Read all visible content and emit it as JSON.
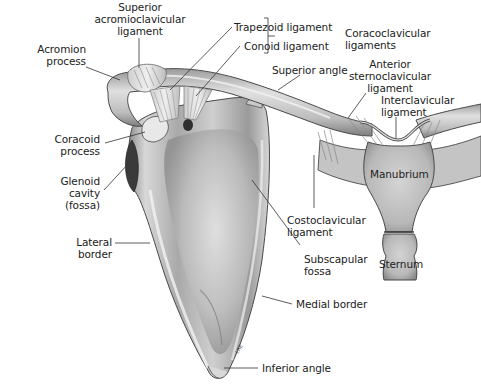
{
  "figure": {
    "signature": "LRE",
    "bottom_caption_cropped": ""
  },
  "labels": {
    "superior_acromioclavicular_ligament": "Superior\nacromioclavicular\nligament",
    "acromion_process": "Acromion\nprocess",
    "trapezoid_ligament": "Trapezoid ligament",
    "conoid_ligament": "Conoid ligament",
    "coracoclavicular_ligaments": "Coracoclavicular\nligaments",
    "superior_angle": "Superior angle",
    "anterior_sternoclavicular_ligament": "Anterior\nsternoclavicular\nligament",
    "interclavicular_ligament": "Interclavicular\nligament",
    "coracoid_process": "Coracoid\nprocess",
    "glenoid_cavity": "Glenoid\ncavity\n(fossa)",
    "manubrium": "Manubrium",
    "lateral_border": "Lateral\nborder",
    "costoclavicular_ligament": "Costoclavicular\nligament",
    "sternum": "Sternum",
    "subscapular_fossa": "Subscapular\nfossa",
    "medial_border": "Medial border",
    "inferior_angle": "Inferior angle"
  },
  "colors": {
    "bone_light": "#e4e4e4",
    "bone_mid": "#b9b9b9",
    "bone_dark": "#6f6f6f",
    "outline": "#4a4a4a",
    "label_text": "#222222",
    "leader_line": "#333333"
  }
}
